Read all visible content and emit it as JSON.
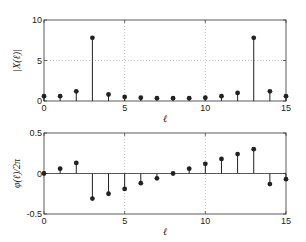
{
  "chart_data": [
    {
      "type": "stem",
      "title": "",
      "xlabel": "ℓ",
      "ylabel": "|X(ℓ)|",
      "xlim": [
        0,
        15
      ],
      "ylim": [
        0,
        10
      ],
      "xticks": [
        0,
        5,
        10,
        15
      ],
      "yticks": [
        0,
        5,
        10
      ],
      "grid": true,
      "x": [
        0,
        1,
        2,
        3,
        4,
        5,
        6,
        7,
        8,
        9,
        10,
        11,
        12,
        13,
        14,
        15
      ],
      "values": [
        0.6,
        0.6,
        1.2,
        7.8,
        0.8,
        0.5,
        0.4,
        0.35,
        0.35,
        0.35,
        0.4,
        0.6,
        1.0,
        7.8,
        1.2,
        0.6
      ]
    },
    {
      "type": "stem",
      "title": "",
      "xlabel": "ℓ",
      "ylabel": "φ(ℓ)/2π",
      "xlim": [
        0,
        15
      ],
      "ylim": [
        -0.5,
        0.5
      ],
      "xticks": [
        0,
        5,
        10,
        15
      ],
      "yticks": [
        -0.5,
        0,
        0.5
      ],
      "grid": true,
      "x": [
        0,
        1,
        2,
        3,
        4,
        5,
        6,
        7,
        8,
        9,
        10,
        11,
        12,
        13,
        14,
        15
      ],
      "values": [
        0,
        0.06,
        0.13,
        -0.31,
        -0.25,
        -0.19,
        -0.12,
        -0.06,
        0,
        0.06,
        0.12,
        0.18,
        0.24,
        0.3,
        -0.13,
        -0.07
      ]
    }
  ],
  "top": {
    "ylabel": "|X(ℓ)|",
    "xlabel": "ℓ",
    "xticks": [
      "0",
      "5",
      "10",
      "15"
    ],
    "yticks": [
      "0",
      "5",
      "10"
    ]
  },
  "bottom": {
    "ylabel": "φ(ℓ)/2π",
    "xlabel": "ℓ",
    "xticks": [
      "0",
      "5",
      "10",
      "15"
    ],
    "yticks": [
      "-0.5",
      "0",
      "0.5"
    ]
  }
}
